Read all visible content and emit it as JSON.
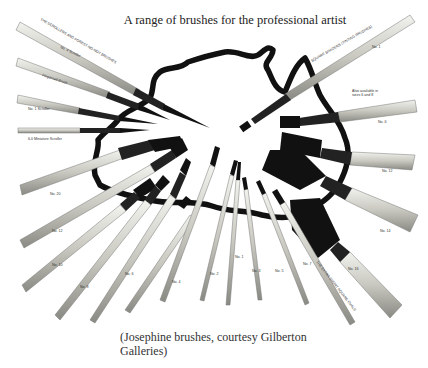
{
  "page": {
    "title": "A range of brushes for the professional artist",
    "caption_line1": "(Josephine brushes, courtesy Gilberton",
    "caption_line2": "Galleries)"
  },
  "illustration": {
    "background_shape": "map-outline-icon",
    "labels": {
      "top_left_series": "THE SCROLLERS AND FOREST-NO-NOT BRUSHES",
      "no4_scroller": "No. 4 Scroller",
      "fingernail_brush": "Fingernail Brush",
      "no1_scroller": "No. 1 Scroller",
      "miniature_scroller": "6.0 Miniature Scroller",
      "top_right_series": "SQUARE SHADERS (TINTING BRUSHES)",
      "no1_right": "No. 1",
      "also_available": "Also available in",
      "also_available2": "sizes 6 and 8",
      "no6": "No. 6",
      "no12": "No. 12",
      "no14": "No. 14",
      "no16": "No. 16",
      "bottom_right_series": "THE EXTRA SHORT SQUARE OVALS",
      "no20": "No. 20",
      "no12_left": "No. 12",
      "no10": "No. 10",
      "no8": "No. 8",
      "no6_b": "No. 6",
      "no4": "No. 4",
      "no2": "No. 2",
      "no1": "No. 1",
      "no0": "No. 0",
      "no3": "No. 3",
      "no5": "No. 5",
      "no7": "No. 7"
    },
    "colors": {
      "ink": "#111111",
      "handle_light": "#d8d8d0",
      "handle_mid": "#a8a8a0",
      "ferrule": "#222222"
    }
  }
}
